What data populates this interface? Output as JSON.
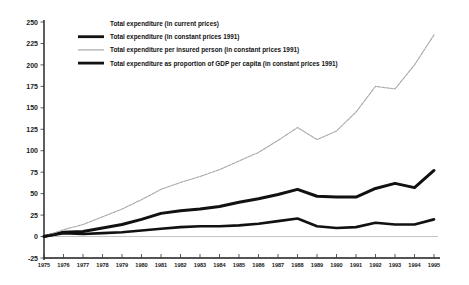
{
  "chart_data": {
    "type": "line",
    "title": "",
    "subtitle": "",
    "xlabel": "",
    "ylabel": "",
    "xlim": [
      1975,
      1995
    ],
    "ylim": [
      -25,
      250
    ],
    "ytick_step": 25,
    "grid": false,
    "legend_position": "top-left-inside",
    "x": [
      1975,
      1976,
      1977,
      1978,
      1979,
      1980,
      1981,
      1982,
      1983,
      1984,
      1985,
      1986,
      1987,
      1988,
      1989,
      1990,
      1991,
      1992,
      1993,
      1994,
      1995
    ],
    "ytick_labels": [
      "250",
      "225",
      "200",
      "175",
      "150",
      "125",
      "100",
      "75",
      "50",
      "25",
      "0",
      "-25"
    ],
    "ytick_values": [
      250,
      225,
      200,
      175,
      150,
      125,
      100,
      75,
      50,
      25,
      0,
      -25
    ],
    "xtick_labels": [
      "1975",
      "1976",
      "1977",
      "1978",
      "1979",
      "1980",
      "1981",
      "1982",
      "1983",
      "1984",
      "1985",
      "1986",
      "1987",
      "1988",
      "1989",
      "1990",
      "1991",
      "1992",
      "1993",
      "1994",
      "1995"
    ],
    "series": [
      {
        "name": "Total expenditure (in current prices)",
        "style": "white-unfilled",
        "color": "#ffffff",
        "width": 1.0,
        "values": [
          0,
          2,
          2,
          2,
          2,
          2,
          2,
          2,
          2,
          2,
          2,
          2,
          2,
          2,
          2,
          2,
          2,
          2,
          2,
          2,
          2
        ]
      },
      {
        "name": "Total expenditure (in constant prices 1991)",
        "style": "thick-black",
        "color": "#111111",
        "width": 3.0,
        "values": [
          0,
          5,
          6,
          10,
          14,
          20,
          27,
          30,
          32,
          35,
          40,
          44,
          49,
          55,
          47,
          46,
          46,
          56,
          62,
          57,
          77
        ]
      },
      {
        "name": "Total expenditure per insured person (in constant prices 1991)",
        "style": "thin-gray",
        "color": "#a8a8a8",
        "width": 1.1,
        "values": [
          0,
          8,
          14,
          23,
          32,
          43,
          55,
          63,
          70,
          78,
          88,
          98,
          112,
          127,
          113,
          123,
          145,
          175,
          172,
          200,
          235
        ]
      },
      {
        "name": "Total expenditure as proportion of GDP per capita (in constant prices 1991)",
        "style": "thick-black",
        "color": "#111111",
        "width": 2.6,
        "values": [
          0,
          4,
          3,
          4,
          5,
          7,
          9,
          11,
          12,
          12,
          13,
          15,
          18,
          21,
          12,
          10,
          11,
          16,
          14,
          14,
          20
        ]
      }
    ]
  },
  "legend": {
    "items": [
      {
        "label": "Total expenditure (in current prices)",
        "swatch": "none"
      },
      {
        "label": "Total expenditure (in constant prices 1991)",
        "swatch": "thick-black"
      },
      {
        "label": "Total expenditure per insured person (in constant prices 1991)",
        "swatch": "thin-gray"
      },
      {
        "label": "Total expenditure as proportion of GDP per capita (in constant prices 1991)",
        "swatch": "thick-black"
      }
    ]
  },
  "colors": {
    "background": "#ffffff",
    "axis": "#1b1b1b",
    "thick_line": "#111111",
    "thin_line": "#a8a8a8",
    "text": "#121212"
  }
}
